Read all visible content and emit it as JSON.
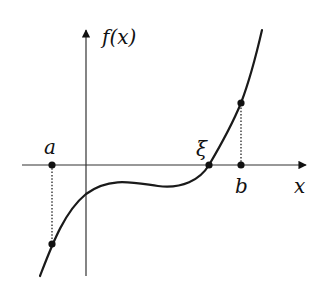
{
  "diagram": {
    "axes": {
      "y_label": "f(x)",
      "x_label": "x"
    },
    "points": {
      "a_label": "a",
      "b_label": "b",
      "xi_label": "ξ"
    },
    "colors": {
      "curve": "#1a1a1a",
      "axis": "#333333",
      "background": "#ffffff"
    }
  }
}
